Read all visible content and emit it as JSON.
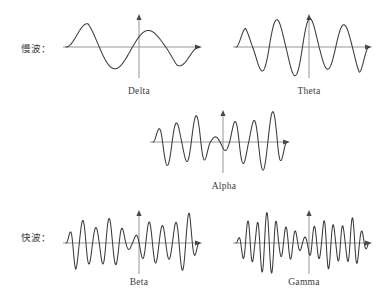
{
  "figure": {
    "background_color": "#ffffff",
    "stroke_color": "#3a3a3a",
    "axis_color": "#8a8a8a"
  },
  "row_labels": {
    "slow": "慢波：",
    "fast": "快波："
  },
  "captions": {
    "delta": "Delta",
    "theta": "Theta",
    "alpha": "Alpha",
    "beta": "Beta",
    "gamma": "Gamma"
  },
  "chart_data": {
    "type": "line",
    "xlabel": "",
    "ylabel": "",
    "grid": false,
    "legend": false,
    "panels": [
      {
        "name": "delta",
        "label": "Delta",
        "row": "slow",
        "cycles": 2,
        "relative_frequency": 1,
        "relative_amplitude": 1.0,
        "axis": {
          "x0": 63,
          "x1": 202,
          "baseline_y": 47,
          "vaxis_x": 139,
          "vaxis_top": 14,
          "vaxis_bottom": 78
        }
      },
      {
        "name": "theta",
        "label": "Theta",
        "row": "slow",
        "cycles": 4,
        "relative_frequency": 2,
        "relative_amplitude": 1.0,
        "axis": {
          "x0": 233,
          "x1": 372,
          "baseline_y": 47,
          "vaxis_x": 309,
          "vaxis_top": 14,
          "vaxis_bottom": 78
        }
      },
      {
        "name": "alpha",
        "label": "Alpha",
        "row": "middle",
        "cycles": 7,
        "relative_frequency": 3.5,
        "relative_amplitude": 0.95,
        "axis": {
          "x0": 150,
          "x1": 290,
          "baseline_y": 142,
          "vaxis_x": 223,
          "vaxis_top": 110,
          "vaxis_bottom": 173
        }
      },
      {
        "name": "beta",
        "label": "Beta",
        "row": "fast",
        "cycles": 10,
        "relative_frequency": 5,
        "relative_amplitude": 0.9,
        "axis": {
          "x0": 63,
          "x1": 202,
          "baseline_y": 243,
          "vaxis_x": 139,
          "vaxis_top": 210,
          "vaxis_bottom": 274
        }
      },
      {
        "name": "gamma",
        "label": "Gamma",
        "row": "fast",
        "cycles": 14,
        "relative_frequency": 7,
        "relative_amplitude": 0.85,
        "axis": {
          "x0": 233,
          "x1": 372,
          "baseline_y": 243,
          "vaxis_x": 309,
          "vaxis_top": 210,
          "vaxis_bottom": 274
        }
      }
    ]
  }
}
